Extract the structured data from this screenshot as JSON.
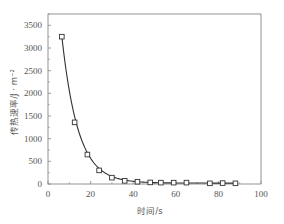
{
  "chart_data": {
    "type": "scatter",
    "title": "",
    "xlabel": "时间/s",
    "ylabel": "传热速率/J · m⁻²",
    "xlim": [
      0,
      100
    ],
    "ylim": [
      0,
      3750
    ],
    "xticks": [
      0,
      20,
      40,
      60,
      80,
      100
    ],
    "xtick_labels": [
      "0",
      "20",
      "40",
      "60",
      "80",
      "100"
    ],
    "yticks": [
      0,
      500,
      1000,
      1500,
      2000,
      2500,
      3000,
      3500
    ],
    "ytick_labels": [
      "0",
      "500",
      "1000",
      "1500",
      "2000",
      "2500",
      "3000",
      "3500"
    ],
    "grid": false,
    "legend": null,
    "series": [
      {
        "name": "measured",
        "marker": "open-square",
        "x": [
          6.5,
          12.5,
          18.5,
          24,
          30,
          36,
          42,
          48,
          53,
          59,
          65,
          76,
          82,
          88
        ],
        "y": [
          3250,
          1360,
          650,
          300,
          140,
          70,
          50,
          35,
          30,
          30,
          30,
          15,
          20,
          15
        ]
      },
      {
        "name": "exponential fit",
        "style": "line",
        "fit": "y = A·exp(-t/τ)",
        "A": 7600,
        "tau": 7.6
      }
    ]
  },
  "axes": {
    "x_title": "时间/s",
    "y_title": "传热速率/J · m⁻²"
  }
}
